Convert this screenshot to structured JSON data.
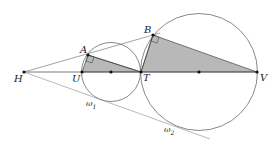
{
  "diagram": {
    "type": "geometry",
    "colors": {
      "stroke": "#444444",
      "light_stroke": "#888888",
      "fill": "#b8b8b8",
      "point": "#111111"
    },
    "points": {
      "H": {
        "label": "H",
        "x": 24,
        "y": 72
      },
      "U": {
        "label": "U",
        "x": 82,
        "y": 72
      },
      "O1": {
        "label": "",
        "x": 111,
        "y": 72
      },
      "T": {
        "label": "T",
        "x": 141,
        "y": 72
      },
      "A": {
        "label": "A",
        "x": 88,
        "y": 55
      },
      "B": {
        "label": "B",
        "x": 153,
        "y": 35
      },
      "O2": {
        "label": "",
        "x": 199,
        "y": 72
      },
      "V": {
        "label": "V",
        "x": 257,
        "y": 72
      }
    },
    "circles": [
      {
        "name": "omega1",
        "label": "ω",
        "sub": "1",
        "cx": 111,
        "cy": 72,
        "r": 29.5
      },
      {
        "name": "omega2",
        "label": "ω",
        "sub": "2",
        "cx": 199,
        "cy": 72,
        "r": 58.5
      }
    ]
  }
}
